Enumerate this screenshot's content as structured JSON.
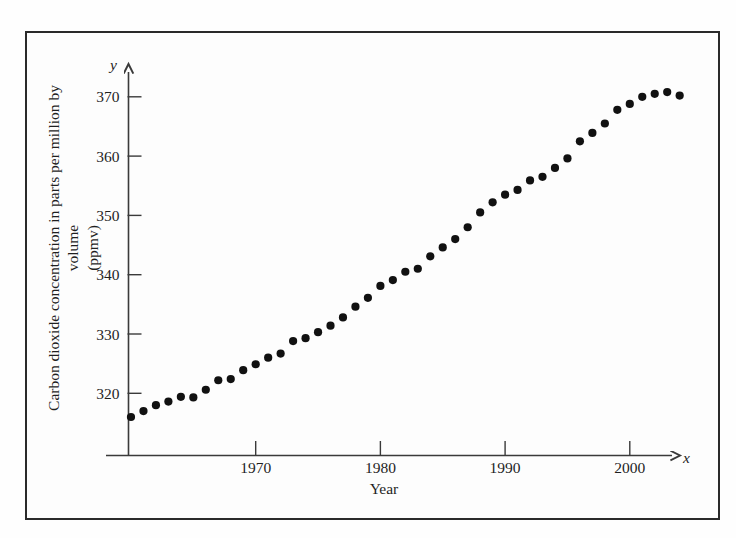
{
  "figure": {
    "border_color": "#2a2a2a",
    "background": "#fdfdfd",
    "point_color": "#111111"
  },
  "labels": {
    "y_axis_line1": "Carbon dioxide concentration in parts per million by volume",
    "y_axis_line2": "(ppmv)",
    "x_axis_title": "Year",
    "x_axis_variable": "x",
    "y_axis_variable": "y"
  },
  "chart_data": {
    "type": "scatter",
    "title": "",
    "xlabel": "Year",
    "ylabel": "Carbon dioxide concentration in parts per million by volume (ppmv)",
    "xlim": [
      1959,
      2005
    ],
    "ylim": [
      313,
      372
    ],
    "grid": false,
    "legend": "none",
    "x_ticks": [
      1970,
      1980,
      1990,
      2000
    ],
    "x_tick_labels": [
      "1970",
      "1980",
      "1990",
      "2000"
    ],
    "y_ticks": [
      320,
      330,
      340,
      350,
      360,
      370
    ],
    "y_tick_labels": [
      "320",
      "330",
      "340",
      "350",
      "360",
      "370"
    ],
    "x": [
      1960,
      1961,
      1962,
      1963,
      1964,
      1965,
      1966,
      1967,
      1968,
      1969,
      1970,
      1971,
      1972,
      1973,
      1974,
      1975,
      1976,
      1977,
      1978,
      1979,
      1980,
      1981,
      1982,
      1983,
      1984,
      1985,
      1986,
      1987,
      1988,
      1989,
      1990,
      1991,
      1992,
      1993,
      1994,
      1995,
      1996,
      1997,
      1998,
      1999,
      2000,
      2001,
      2002,
      2003,
      2004
    ],
    "y": [
      316.0,
      317.0,
      318.0,
      318.6,
      319.4,
      319.3,
      320.6,
      322.2,
      322.4,
      323.9,
      324.9,
      326.0,
      326.7,
      328.8,
      329.3,
      330.3,
      331.4,
      332.8,
      334.6,
      336.1,
      338.1,
      339.1,
      340.5,
      341.0,
      343.1,
      344.6,
      346.0,
      348.0,
      350.5,
      352.2,
      353.5,
      354.3,
      355.9,
      356.5,
      358.0,
      359.6,
      362.5,
      363.9,
      365.5,
      367.8,
      368.8,
      370.0,
      370.5,
      370.8,
      370.2
    ],
    "series_name": "CO2 concentration",
    "point_count": 45
  }
}
